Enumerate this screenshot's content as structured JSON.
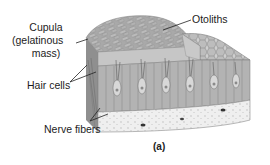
{
  "figure": {
    "caption": "(a)",
    "labels": {
      "cupula_line1": "Cupula",
      "cupula_line2": "(gelatinous",
      "cupula_line3": "mass)",
      "otoliths": "Otoliths",
      "hair_cells": "Hair cells",
      "nerve_fibers": "Nerve fibers"
    },
    "colors": {
      "background": "#ffffff",
      "tissue_gray": "#9a9a9a",
      "otolith_gray": "#b4b4b4",
      "membrane_light": "#d6d6d6",
      "hair_cell_layer": "#a8a8a8",
      "basement_layer": "#ececec",
      "leader_line": "#222222",
      "text": "#1c1c1c"
    }
  }
}
